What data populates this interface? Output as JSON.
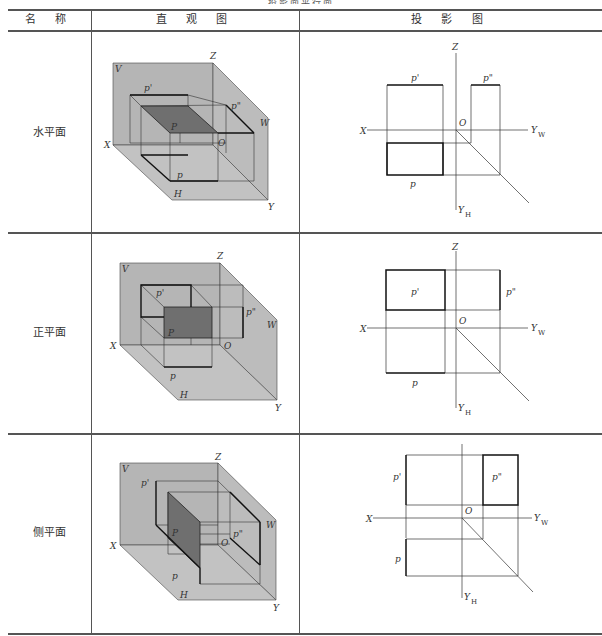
{
  "table": {
    "caption": "投影面平行面",
    "headers": [
      "名 称",
      "直 观 图",
      "投 影 图"
    ],
    "rows": [
      {
        "name": "水平面",
        "pictorial": {
          "labels": {
            "V": "V",
            "Z": "Z",
            "W": "W",
            "X": "X",
            "H": "H",
            "Y": "Y",
            "O": "O",
            "P": "P",
            "p": "p",
            "p1": "p'",
            "p2": "p\""
          }
        },
        "projection": {
          "labels": {
            "Z": "Z",
            "X": "X",
            "O": "O",
            "YW": "Y",
            "YWsub": "W",
            "YH": "Y",
            "YHsub": "H",
            "p": "p",
            "p1": "p'",
            "p2": "p\""
          }
        }
      },
      {
        "name": "正平面",
        "pictorial": {
          "labels": {
            "V": "V",
            "Z": "Z",
            "W": "W",
            "X": "X",
            "H": "H",
            "Y": "Y",
            "O": "O",
            "P": "P",
            "p": "p",
            "p1": "p'",
            "p2": "p\""
          }
        },
        "projection": {
          "labels": {
            "Z": "Z",
            "X": "X",
            "O": "O",
            "YW": "Y",
            "YWsub": "W",
            "YH": "Y",
            "YHsub": "H",
            "p": "p",
            "p1": "p'",
            "p2": "p\""
          }
        }
      },
      {
        "name": "侧平面",
        "pictorial": {
          "labels": {
            "V": "V",
            "Z": "Z",
            "W": "W",
            "X": "X",
            "H": "H",
            "Y": "Y",
            "O": "O",
            "P": "P",
            "p": "p",
            "p1": "p'",
            "p2": "p\""
          }
        },
        "projection": {
          "labels": {
            "X": "X",
            "O": "O",
            "YW": "Y",
            "YWsub": "W",
            "YH": "Y",
            "YHsub": "H",
            "p": "p",
            "p1": "p'",
            "p2": "p\""
          }
        }
      }
    ]
  },
  "colors": {
    "plane_fill": "#b5b5b5",
    "highlight_fill": "#6f6f6f",
    "line": "#333333"
  }
}
